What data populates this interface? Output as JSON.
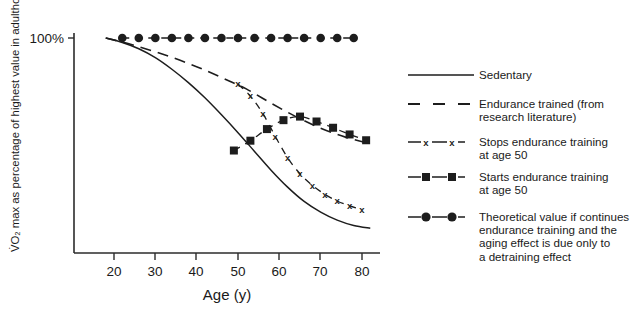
{
  "chart_data": {
    "type": "line",
    "title": "",
    "xlabel": "Age (y)",
    "ylabel": "V̇O₂ max as percentage of highest value in adulthood",
    "xlim": [
      13,
      85
    ],
    "ylim": [
      40,
      104
    ],
    "xticks": [
      20,
      30,
      40,
      50,
      60,
      70,
      80
    ],
    "xticklabels": [
      "20",
      "30",
      "40",
      "50",
      "60",
      "70",
      "80"
    ],
    "yticks": [
      100
    ],
    "yticklabels": [
      "100%"
    ],
    "grid": false,
    "legend_position": "right",
    "series": [
      {
        "name": "Sedentary",
        "key": "sedentary",
        "style": "solid",
        "marker": "none",
        "x": [
          18,
          22,
          26,
          30,
          34,
          38,
          42,
          46,
          50,
          54,
          58,
          62,
          66,
          70,
          74,
          78,
          82
        ],
        "y": [
          100.0,
          99.0,
          97.6,
          95.6,
          93.0,
          90.0,
          86.6,
          82.8,
          78.8,
          74.6,
          70.4,
          66.6,
          63.4,
          61.0,
          59.2,
          58.0,
          57.4
        ]
      },
      {
        "name": "Endurance trained (from research literature)",
        "key": "endurance",
        "style": "long-dash",
        "marker": "none",
        "x": [
          18,
          24,
          30,
          36,
          42,
          48,
          52,
          58,
          64,
          70,
          76,
          82
        ],
        "y": [
          100.0,
          98.6,
          96.9,
          95.0,
          92.8,
          90.3,
          88.6,
          85.4,
          82.4,
          79.8,
          77.8,
          76.3
        ]
      },
      {
        "name": "Stops endurance training at age 50",
        "key": "stops",
        "style": "dashed",
        "marker": "x",
        "x": [
          50,
          53,
          56,
          59,
          62,
          65,
          68,
          71,
          74,
          77,
          80
        ],
        "y": [
          89.7,
          87.0,
          83.1,
          78.0,
          73.2,
          69.6,
          67.0,
          65.0,
          63.5,
          62.4,
          61.6
        ]
      },
      {
        "name": "Starts endurance training at age 50",
        "key": "starts",
        "style": "dashed",
        "marker": "square",
        "x": [
          49,
          53,
          57,
          61,
          65,
          69,
          73,
          77,
          81
        ],
        "y": [
          74.8,
          77.0,
          79.6,
          81.6,
          82.4,
          81.3,
          79.9,
          78.4,
          77.1
        ]
      },
      {
        "name": "Theoretical value if continues endurance training and the aging effect is due only to a detraining effect",
        "key": "theory",
        "style": "dashed",
        "marker": "circle",
        "x": [
          22,
          26,
          30,
          34,
          38,
          42,
          46,
          50,
          54,
          58,
          62,
          66,
          70,
          74,
          78
        ],
        "y": [
          100,
          100,
          100,
          100,
          100,
          100,
          100,
          100,
          100,
          100,
          100,
          100,
          100,
          100,
          100
        ]
      }
    ]
  },
  "axis": {
    "y_label": "V̇O₂ max as percentage of highest value in adulthood",
    "y_tick_100": "100%",
    "x_label": "Age (y)",
    "x_tick_20": "20",
    "x_tick_30": "30",
    "x_tick_40": "40",
    "x_tick_50": "50",
    "x_tick_60": "60",
    "x_tick_70": "70",
    "x_tick_80": "80"
  },
  "legend": {
    "items": [
      {
        "id": "sedentary",
        "marker": "none",
        "lines": [
          "Sedentary"
        ]
      },
      {
        "id": "endurance-trained",
        "marker": "none",
        "lines": [
          "Endurance trained (from",
          "research literature)"
        ]
      },
      {
        "id": "stops-training",
        "marker": "x",
        "lines": [
          "Stops endurance training",
          "at age 50"
        ]
      },
      {
        "id": "starts-training",
        "marker": "square",
        "lines": [
          "Starts endurance training",
          "at age 50"
        ]
      },
      {
        "id": "theoretical-value",
        "marker": "circle",
        "lines": [
          "Theoretical value if continues",
          "endurance training and the",
          "aging effect is due only to",
          "a detraining effect"
        ]
      }
    ]
  },
  "colors": {
    "ink": "#1a1a1a",
    "line": "#1d1d1d",
    "background": "#ffffff"
  }
}
